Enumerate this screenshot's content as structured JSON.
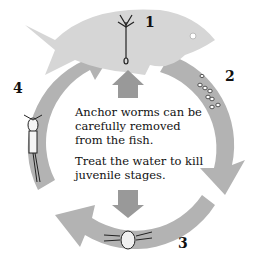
{
  "diagram": {
    "type": "life-cycle",
    "subject": "Anchor worm",
    "stages": [
      {
        "number": "1",
        "icon": "anchor-worm-on-fish-icon"
      },
      {
        "number": "2",
        "icon": "eggs-icon"
      },
      {
        "number": "3",
        "icon": "nauplius-larva-icon"
      },
      {
        "number": "4",
        "icon": "copepodid-juvenile-icon"
      }
    ],
    "caption": {
      "line1": "Anchor worms can be carefully removed from the fish.",
      "line2": "Treat the water to kill juvenile stages."
    },
    "colors": {
      "arrow": "#b3b3b3",
      "fish": "#d6d6d6",
      "background": "#ffffff",
      "text": "#111111"
    }
  }
}
